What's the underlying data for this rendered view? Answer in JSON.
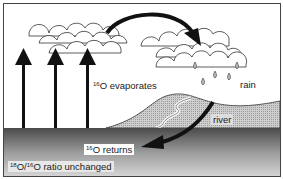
{
  "diagram": {
    "title": "",
    "type": "oxygen isotope water cycle",
    "labels": {
      "evaporates": {
        "sup": "16",
        "text": "O evaporates"
      },
      "rain": "rain",
      "river": "river",
      "returns": {
        "sup": "16",
        "text": "O returns"
      },
      "ratio": {
        "sup1": "18",
        "mid": "O/",
        "sup2": "16",
        "text": "O ratio unchanged"
      }
    },
    "elements": [
      "clouds",
      "evaporation arrows",
      "transport arrow",
      "rain drops",
      "land",
      "river",
      "runoff arrow",
      "sea"
    ],
    "colors": {
      "ink": "#1a1a1a",
      "land": "#c8c8c8",
      "sea_top": "#555555",
      "sea_bottom": "#d0d0d0"
    }
  }
}
